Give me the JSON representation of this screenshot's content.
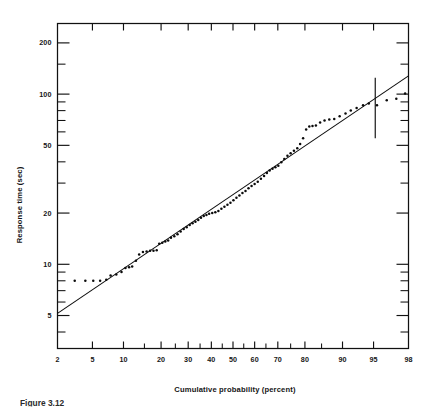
{
  "figure": {
    "caption_partial": "Figure 3.12",
    "background_color": "#ffffff",
    "ink_color": "#111111"
  },
  "chart_data": {
    "type": "scatter",
    "title": "",
    "subtitle": "",
    "xlabel": "Cumulative probability (percent)",
    "ylabel": "Response time (sec)",
    "x_scale": "probability",
    "y_scale": "log",
    "grid": false,
    "legend": false,
    "xlim": [
      2,
      98
    ],
    "ylim": [
      3.2,
      260
    ],
    "x_ticks_labeled": [
      2,
      5,
      10,
      20,
      30,
      40,
      50,
      60,
      70,
      80,
      90,
      95,
      98
    ],
    "x_tick_labels": [
      "2",
      "5",
      "10",
      "20",
      "30",
      "40",
      "50",
      "60",
      "70",
      "80",
      "90",
      "95",
      "98"
    ],
    "x_ticks_unlabeled": [
      15,
      25,
      35,
      45,
      55,
      65,
      75,
      85
    ],
    "y_ticks_labeled": [
      5,
      10,
      20,
      50,
      100,
      200
    ],
    "y_tick_labels": [
      "5",
      "10",
      "20",
      "50",
      "100",
      "200"
    ],
    "y_ticks_minor": [
      4,
      6,
      7,
      8,
      9,
      30,
      40,
      60,
      70,
      80,
      90,
      150
    ],
    "annotations": [
      {
        "name": "percentile-marker",
        "kind": "vertical-bar",
        "x": 95.2,
        "y_low": 55,
        "y_high": 125,
        "label": ""
      }
    ],
    "series": [
      {
        "name": "Fitted lognormal line",
        "kind": "line",
        "points": [
          {
            "x": 2,
            "y": 5.15
          },
          {
            "x": 98,
            "y": 128
          }
        ]
      },
      {
        "name": "Observed response times",
        "kind": "scatter",
        "marker": "dot",
        "points": [
          {
            "x": 3.2,
            "y": 8.0
          },
          {
            "x": 4.2,
            "y": 8.0
          },
          {
            "x": 5.1,
            "y": 8.0
          },
          {
            "x": 6.0,
            "y": 8.0
          },
          {
            "x": 6.9,
            "y": 8.1
          },
          {
            "x": 7.6,
            "y": 8.6
          },
          {
            "x": 8.6,
            "y": 8.7
          },
          {
            "x": 9.6,
            "y": 9.0
          },
          {
            "x": 10.4,
            "y": 9.5
          },
          {
            "x": 11.2,
            "y": 9.6
          },
          {
            "x": 11.9,
            "y": 9.7
          },
          {
            "x": 12.8,
            "y": 10.5
          },
          {
            "x": 13.6,
            "y": 11.4
          },
          {
            "x": 14.6,
            "y": 11.8
          },
          {
            "x": 15.6,
            "y": 11.9
          },
          {
            "x": 16.6,
            "y": 12.0
          },
          {
            "x": 17.6,
            "y": 12.0
          },
          {
            "x": 18.6,
            "y": 12.1
          },
          {
            "x": 19.4,
            "y": 13.2
          },
          {
            "x": 20.4,
            "y": 13.4
          },
          {
            "x": 21.4,
            "y": 13.6
          },
          {
            "x": 22.4,
            "y": 13.8
          },
          {
            "x": 23.4,
            "y": 14.3
          },
          {
            "x": 24.6,
            "y": 14.6
          },
          {
            "x": 25.8,
            "y": 15.0
          },
          {
            "x": 27.0,
            "y": 15.6
          },
          {
            "x": 28.2,
            "y": 16.1
          },
          {
            "x": 29.4,
            "y": 16.5
          },
          {
            "x": 30.6,
            "y": 17.0
          },
          {
            "x": 31.8,
            "y": 17.4
          },
          {
            "x": 33.0,
            "y": 17.8
          },
          {
            "x": 34.2,
            "y": 18.2
          },
          {
            "x": 35.4,
            "y": 18.8
          },
          {
            "x": 36.6,
            "y": 19.2
          },
          {
            "x": 37.8,
            "y": 19.5
          },
          {
            "x": 39.0,
            "y": 19.8
          },
          {
            "x": 40.4,
            "y": 20.0
          },
          {
            "x": 41.8,
            "y": 20.2
          },
          {
            "x": 43.2,
            "y": 20.6
          },
          {
            "x": 44.6,
            "y": 21.2
          },
          {
            "x": 46.0,
            "y": 21.8
          },
          {
            "x": 47.4,
            "y": 22.4
          },
          {
            "x": 48.8,
            "y": 23.0
          },
          {
            "x": 50.2,
            "y": 23.8
          },
          {
            "x": 51.6,
            "y": 24.6
          },
          {
            "x": 53.0,
            "y": 25.4
          },
          {
            "x": 54.4,
            "y": 26.2
          },
          {
            "x": 55.8,
            "y": 27.0
          },
          {
            "x": 57.2,
            "y": 28.0
          },
          {
            "x": 58.6,
            "y": 28.8
          },
          {
            "x": 60.0,
            "y": 29.6
          },
          {
            "x": 61.4,
            "y": 30.6
          },
          {
            "x": 62.8,
            "y": 31.8
          },
          {
            "x": 64.2,
            "y": 33.0
          },
          {
            "x": 65.4,
            "y": 34.4
          },
          {
            "x": 66.6,
            "y": 35.6
          },
          {
            "x": 67.8,
            "y": 36.4
          },
          {
            "x": 69.0,
            "y": 37.2
          },
          {
            "x": 70.2,
            "y": 38.0
          },
          {
            "x": 71.4,
            "y": 39.8
          },
          {
            "x": 72.6,
            "y": 41.6
          },
          {
            "x": 73.8,
            "y": 43.4
          },
          {
            "x": 75.0,
            "y": 45.0
          },
          {
            "x": 76.2,
            "y": 46.4
          },
          {
            "x": 77.4,
            "y": 48.0
          },
          {
            "x": 78.4,
            "y": 51.0
          },
          {
            "x": 79.4,
            "y": 55.0
          },
          {
            "x": 80.4,
            "y": 62.0
          },
          {
            "x": 81.4,
            "y": 64.5
          },
          {
            "x": 82.4,
            "y": 65.0
          },
          {
            "x": 83.4,
            "y": 65.5
          },
          {
            "x": 84.6,
            "y": 68.0
          },
          {
            "x": 85.8,
            "y": 70.0
          },
          {
            "x": 87.0,
            "y": 71.0
          },
          {
            "x": 88.2,
            "y": 71.5
          },
          {
            "x": 89.4,
            "y": 74.0
          },
          {
            "x": 90.6,
            "y": 77.0
          },
          {
            "x": 91.6,
            "y": 80.0
          },
          {
            "x": 92.6,
            "y": 83.0
          },
          {
            "x": 93.6,
            "y": 86.0
          },
          {
            "x": 94.4,
            "y": 88.0
          },
          {
            "x": 95.4,
            "y": 86.0
          },
          {
            "x": 96.4,
            "y": 92.0
          },
          {
            "x": 97.2,
            "y": 94.0
          },
          {
            "x": 97.8,
            "y": 101.0
          }
        ]
      }
    ]
  }
}
